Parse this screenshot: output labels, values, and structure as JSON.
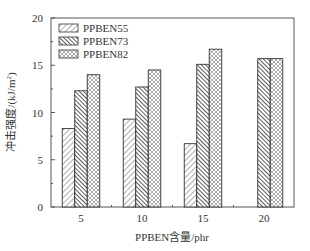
{
  "chart_data": {
    "type": "bar",
    "title": "",
    "xlabel": "PPBEN含量/phr",
    "ylabel": "冲击强度/(kJ/m²)",
    "ylabel_main": "冲击强度/(kJ/m",
    "ylabel_sup": "2",
    "ylabel_close": ")",
    "ylim": [
      0,
      20
    ],
    "yticks": [
      0,
      5,
      10,
      15,
      20
    ],
    "categories": [
      "5",
      "10",
      "15",
      "20"
    ],
    "series": [
      {
        "name": "PPBEN55",
        "pattern": "diag-fine",
        "values": [
          8.3,
          9.3,
          6.7,
          null
        ]
      },
      {
        "name": "PPBEN73",
        "pattern": "diag-dense",
        "values": [
          12.3,
          12.7,
          15.1,
          15.7
        ]
      },
      {
        "name": "PPBEN82",
        "pattern": "crosshatch",
        "values": [
          14.0,
          14.5,
          16.7,
          15.7
        ]
      }
    ],
    "legend_position": "upper-left",
    "grid": false
  }
}
